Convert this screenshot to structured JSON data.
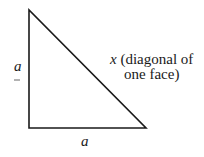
{
  "diagram": {
    "type": "right-triangle",
    "vertices": {
      "top": [
        29,
        10
      ],
      "bottom_left": [
        29,
        128
      ],
      "bottom_right": [
        146,
        128
      ]
    },
    "labels": {
      "left_side": "a",
      "bottom_side": "a",
      "hypotenuse_var": "x",
      "hypotenuse_line1": "(diagonal of",
      "hypotenuse_line2": "one face)"
    },
    "colors": {
      "stroke": "#1a1a1a",
      "background": "#ffffff"
    }
  }
}
